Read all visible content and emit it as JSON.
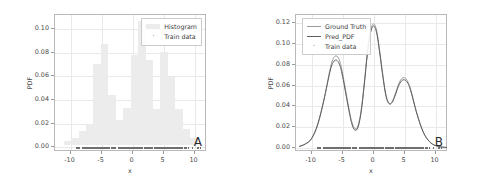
{
  "figure": {
    "background": "#ffffff",
    "axis_color": "#b9b9b9",
    "grid_color": "#e9e9e9"
  },
  "chart_data": [
    {
      "type": "bar",
      "panel_tag": "A",
      "title": "",
      "xlabel": "x",
      "ylabel": "PDF",
      "xlim": [
        -12.5,
        12.0
      ],
      "ylim": [
        -0.004,
        0.112
      ],
      "xticks": [
        -10,
        -5,
        0,
        5,
        10
      ],
      "xtick_labels": [
        "-10",
        "-5",
        "0",
        "5",
        "10"
      ],
      "yticks": [
        0.0,
        0.02,
        0.04,
        0.06,
        0.08,
        0.1
      ],
      "ytick_labels": [
        "0.00",
        "0.02",
        "0.04",
        "0.06",
        "0.08",
        "0.10"
      ],
      "grid": true,
      "legend_position": "upper right",
      "legend": [
        {
          "label": "Histogram",
          "marker": "patch",
          "color": "#ececec"
        },
        {
          "label": "Train data",
          "marker": "dot",
          "color": "#6f6f6f"
        }
      ],
      "bin_edges": [
        -11.1,
        -9.9,
        -8.7,
        -7.5,
        -6.3,
        -5.1,
        -3.9,
        -2.7,
        -1.5,
        -0.3,
        0.9,
        2.1,
        3.3,
        4.5,
        5.7,
        6.9,
        8.1,
        9.3,
        10.5
      ],
      "values": [
        0.0035,
        0.006,
        0.012,
        0.017,
        0.069,
        0.0855,
        0.043,
        0.0215,
        0.032,
        0.0765,
        0.105,
        0.072,
        0.031,
        0.079,
        0.0575,
        0.031,
        0.0135,
        0.006
      ],
      "bar_color": "#ececec",
      "rug_label": "Train data",
      "rug_color": "#6f6f6f"
    },
    {
      "type": "line",
      "panel_tag": "B",
      "title": "",
      "xlabel": "x",
      "ylabel": "PDF",
      "xlim": [
        -12.5,
        12.0
      ],
      "ylim": [
        -0.004,
        0.128
      ],
      "xticks": [
        -10,
        -5,
        0,
        5,
        10
      ],
      "xtick_labels": [
        "-10",
        "-5",
        "0",
        "5",
        "10"
      ],
      "yticks": [
        0.0,
        0.02,
        0.04,
        0.06,
        0.08,
        0.1,
        0.12
      ],
      "ytick_labels": [
        "0.00",
        "0.02",
        "0.04",
        "0.06",
        "0.08",
        "0.10",
        "0.12"
      ],
      "grid": true,
      "legend_position": "upper left",
      "legend": [
        {
          "label": "Ground Truth",
          "marker": "line",
          "color": "#9a9a9a"
        },
        {
          "label": "Pred_PDF",
          "marker": "line",
          "color": "#5e5e5e"
        },
        {
          "label": "Train data",
          "marker": "dot",
          "color": "#6f6f6f"
        }
      ],
      "x": [
        -12.0,
        -11.0,
        -10.0,
        -9.0,
        -8.0,
        -7.0,
        -6.5,
        -6.0,
        -5.5,
        -5.0,
        -4.0,
        -3.5,
        -3.0,
        -2.5,
        -2.0,
        -1.5,
        -1.0,
        -0.5,
        0.0,
        0.5,
        1.0,
        1.5,
        2.0,
        2.5,
        3.0,
        3.5,
        4.0,
        4.5,
        5.0,
        5.5,
        6.0,
        7.0,
        8.0,
        9.0,
        10.0,
        11.0,
        11.8
      ],
      "series": [
        {
          "name": "Ground Truth",
          "color": "#9a9a9a",
          "values": [
            0.0012,
            0.0035,
            0.0085,
            0.022,
            0.046,
            0.076,
            0.086,
            0.0885,
            0.0845,
            0.072,
            0.039,
            0.025,
            0.0185,
            0.0215,
            0.036,
            0.062,
            0.092,
            0.113,
            0.1195,
            0.113,
            0.093,
            0.07,
            0.051,
            0.043,
            0.0445,
            0.052,
            0.061,
            0.0665,
            0.0675,
            0.064,
            0.056,
            0.033,
            0.0155,
            0.0062,
            0.0022,
            0.0008,
            0.0004
          ]
        },
        {
          "name": "Pred_PDF",
          "color": "#5e5e5e",
          "values": [
            0.0014,
            0.0038,
            0.009,
            0.0228,
            0.0462,
            0.074,
            0.0825,
            0.0845,
            0.0805,
            0.069,
            0.037,
            0.0232,
            0.017,
            0.02,
            0.0345,
            0.0605,
            0.09,
            0.1105,
            0.1175,
            0.1108,
            0.0912,
            0.0688,
            0.05,
            0.0425,
            0.0438,
            0.0508,
            0.0592,
            0.0645,
            0.0655,
            0.0625,
            0.0548,
            0.0325,
            0.0152,
            0.006,
            0.0021,
            0.0008,
            0.0004
          ]
        }
      ],
      "rug_label": "Train data",
      "rug_color": "#6f6f6f"
    }
  ]
}
